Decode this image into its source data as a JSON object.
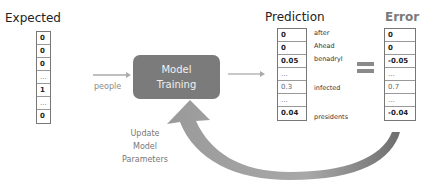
{
  "expected": {
    "title": "Expected",
    "cells": [
      "0",
      "0",
      "0",
      "...",
      "1",
      "...",
      "0"
    ]
  },
  "input_word": "people",
  "model": {
    "line1": "Model",
    "line2": "Training"
  },
  "prediction": {
    "title": "Prediction",
    "cells": [
      "0",
      "0",
      "0.05",
      "...",
      "0.3",
      "...",
      "0.04"
    ],
    "words": [
      "after",
      "Ahead",
      "benadryl",
      "infected",
      "presidents"
    ]
  },
  "error": {
    "title": "Error",
    "cells": [
      "0",
      "0",
      "-0.05",
      "...",
      "0.7",
      "...",
      "-0.04"
    ]
  },
  "feedback": {
    "line1": "Update",
    "line2": "Model",
    "line3": "Parameters"
  },
  "colors": {
    "model_box": "#7b7b7b",
    "arrow": "#8c8c8c",
    "equals": "#8a8a8a"
  }
}
